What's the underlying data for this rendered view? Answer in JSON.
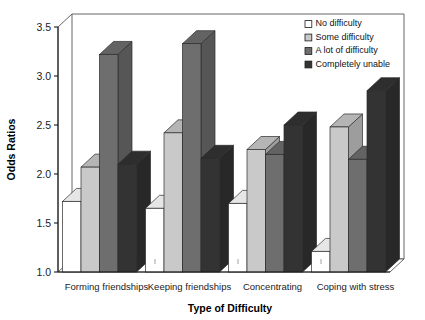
{
  "chart_data": {
    "type": "bar",
    "title": "",
    "subtitle": "",
    "xlabel": "Type of Difficulty",
    "ylabel": "Odds Ratios",
    "categories": [
      "Forming friendships",
      "Keeping friendships",
      "Concentrating",
      "Coping with stress"
    ],
    "series": [
      {
        "name": "No difficulty",
        "values": [
          1.72,
          1.65,
          1.7,
          1.21
        ],
        "color": "#ffffff"
      },
      {
        "name": "Some difficulty",
        "values": [
          2.07,
          2.42,
          2.25,
          2.48
        ],
        "color": "#c9c9c9"
      },
      {
        "name": "A lot of difficulty",
        "values": [
          3.22,
          3.33,
          2.2,
          2.15
        ],
        "color": "#6e6e6e"
      },
      {
        "name": "Completely unable",
        "values": [
          2.1,
          2.16,
          2.5,
          2.85
        ],
        "color": "#333333"
      }
    ],
    "ylim": [
      1.0,
      3.5
    ],
    "ytick_labels": [
      "1.0",
      "1.5",
      "2.0",
      "2.5",
      "3.0",
      "3.5"
    ],
    "ytick_values": [
      1.0,
      1.5,
      2.0,
      2.5,
      3.0,
      3.5
    ],
    "grid": false,
    "legend_position": "top-right",
    "style": "3d-extruded-bars",
    "axis_color": "#555555",
    "plot_background": "#ffffff"
  },
  "axis": {
    "y_title": "Odds Ratios",
    "x_title": "Type of Difficulty"
  },
  "legend": {
    "entries": [
      {
        "label": "No difficulty"
      },
      {
        "label": "Some difficulty"
      },
      {
        "label": "A lot of difficulty"
      },
      {
        "label": "Completely unable"
      }
    ]
  }
}
